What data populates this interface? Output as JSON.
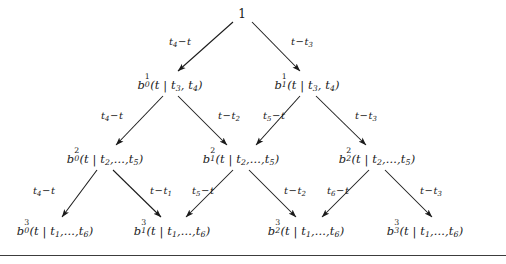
{
  "figure": {
    "type": "recursion-tree",
    "title": "",
    "background_color": "#ffffff",
    "ink_color": "#1a1a1a",
    "rule_color": "#3c3c3c"
  },
  "nodes": {
    "root": {
      "label": "1",
      "x": 242,
      "y": 14
    },
    "level1": [
      {
        "base": "b",
        "sub": "0",
        "sup": "1",
        "args": "(t | t",
        "argsub1": "3",
        "argmid": ", t",
        "argsub2": "4",
        "argend": ")",
        "text": "b_0^1(t | t_3, t_4)",
        "x": 170,
        "y": 85
      },
      {
        "base": "b",
        "sub": "1",
        "sup": "1",
        "args": "(t | t",
        "argsub1": "3",
        "argmid": ", t",
        "argsub2": "4",
        "argend": ")",
        "text": "b_1^1(t | t_3, t_4)",
        "x": 307,
        "y": 85
      }
    ],
    "level2": [
      {
        "base": "b",
        "sub": "0",
        "sup": "2",
        "args": "(t | t",
        "argsub1": "2",
        "argmid": ",...,t",
        "argsub2": "5",
        "argend": ")",
        "text": "b_0^2(t | t_2,...,t_5)",
        "x": 105,
        "y": 159
      },
      {
        "base": "b",
        "sub": "1",
        "sup": "2",
        "args": "(t | t",
        "argsub1": "2",
        "argmid": ",...,t",
        "argsub2": "5",
        "argend": ")",
        "text": "b_1^2(t | t_2,...,t_5)",
        "x": 241,
        "y": 159
      },
      {
        "base": "b",
        "sub": "2",
        "sup": "2",
        "args": "(t | t",
        "argsub1": "2",
        "argmid": ",...,t",
        "argsub2": "5",
        "argend": ")",
        "text": "b_2^2(t | t_2,...,t_5)",
        "x": 377,
        "y": 159
      }
    ],
    "level3": [
      {
        "base": "b",
        "sub": "0",
        "sup": "3",
        "args": "(t | t",
        "argsub1": "1",
        "argmid": ",...,t",
        "argsub2": "6",
        "argend": ")",
        "text": "b_0^3(t | t_1,...,t_6)",
        "x": 55,
        "y": 231
      },
      {
        "base": "b",
        "sub": "1",
        "sup": "3",
        "args": "(t | t",
        "argsub1": "1",
        "argmid": ",...,t",
        "argsub2": "6",
        "argend": ")",
        "text": "b_1^3(t | t_1,...,t_6)",
        "x": 172,
        "y": 231
      },
      {
        "base": "b",
        "sub": "2",
        "sup": "3",
        "args": "(t | t",
        "argsub1": "1",
        "argmid": ",...,t",
        "argsub2": "6",
        "argend": ")",
        "text": "b_2^3(t | t_1,...,t_6)",
        "x": 306,
        "y": 231
      },
      {
        "base": "b",
        "sub": "3",
        "sup": "3",
        "args": "(t | t",
        "argsub1": "1",
        "argmid": ",...,t",
        "argsub2": "6",
        "argend": ")",
        "text": "b_3^3(t | t_1,...,t_6)",
        "x": 425,
        "y": 231
      }
    ]
  },
  "edges": [
    {
      "from": "root",
      "to": "level1.0",
      "x1": 233,
      "y1": 22,
      "x2": 178,
      "y2": 72,
      "label": "t_4 - t",
      "lead": "t",
      "leadsub": "4",
      "tail": "t",
      "lx": 180,
      "ly": 43
    },
    {
      "from": "root",
      "to": "level1.1",
      "x1": 252,
      "y1": 22,
      "x2": 300,
      "y2": 72,
      "label": "t - t_3",
      "lead": "t",
      "leadsub": "",
      "tail": "t",
      "tailsub": "3",
      "lx": 302,
      "ly": 43
    },
    {
      "from": "level1.0",
      "to": "level2.0",
      "x1": 163,
      "y1": 96,
      "x2": 116,
      "y2": 146,
      "label": "t_4 - t",
      "lx": 112,
      "ly": 117
    },
    {
      "from": "level1.0",
      "to": "level2.1",
      "x1": 178,
      "y1": 96,
      "x2": 227,
      "y2": 146,
      "label": "t - t_2",
      "lx": 229,
      "ly": 117
    },
    {
      "from": "level1.1",
      "to": "level2.1",
      "x1": 300,
      "y1": 96,
      "x2": 255,
      "y2": 146,
      "label": "t_5 - t",
      "lx": 272,
      "ly": 117
    },
    {
      "from": "level1.1",
      "to": "level2.2",
      "x1": 316,
      "y1": 96,
      "x2": 366,
      "y2": 146,
      "label": "t - t_3",
      "lx": 365,
      "ly": 117
    },
    {
      "from": "level2.0",
      "to": "level3.0",
      "x1": 97,
      "y1": 170,
      "x2": 62,
      "y2": 218,
      "label": "t_4 - t",
      "lx": 44,
      "ly": 192
    },
    {
      "from": "level2.0",
      "to": "level3.1",
      "x1": 113,
      "y1": 170,
      "x2": 161,
      "y2": 218,
      "label": "t - t_1",
      "lx": 160,
      "ly": 192
    },
    {
      "from": "level2.1",
      "to": "level3.1",
      "x1": 233,
      "y1": 170,
      "x2": 185,
      "y2": 218,
      "label": "t_5 - t",
      "lx": 200,
      "ly": 192
    },
    {
      "from": "level2.1",
      "to": "level3.2",
      "x1": 249,
      "y1": 170,
      "x2": 296,
      "y2": 218,
      "label": "t - t_2",
      "lx": 294,
      "ly": 192
    },
    {
      "from": "level2.2",
      "to": "level3.2",
      "x1": 369,
      "y1": 170,
      "x2": 321,
      "y2": 218,
      "label": "t_6 - t",
      "lx": 335,
      "ly": 192
    },
    {
      "from": "level2.2",
      "to": "level3.3",
      "x1": 385,
      "y1": 170,
      "x2": 432,
      "y2": 218,
      "label": "t - t_3",
      "lx": 430,
      "ly": 192
    }
  ],
  "edge_labels": {
    "e0": {
      "a": "t",
      "asub": "4",
      "op": "−",
      "b": "t",
      "bsub": ""
    },
    "e1": {
      "a": "t",
      "asub": "",
      "op": "−",
      "b": "t",
      "bsub": "3"
    },
    "e2": {
      "a": "t",
      "asub": "4",
      "op": "−",
      "b": "t",
      "bsub": ""
    },
    "e3": {
      "a": "t",
      "asub": "",
      "op": "−",
      "b": "t",
      "bsub": "2"
    },
    "e4": {
      "a": "t",
      "asub": "5",
      "op": "−",
      "b": "t",
      "bsub": ""
    },
    "e5": {
      "a": "t",
      "asub": "",
      "op": "−",
      "b": "t",
      "bsub": "3"
    },
    "e6": {
      "a": "t",
      "asub": "4",
      "op": "−",
      "b": "t",
      "bsub": ""
    },
    "e7": {
      "a": "t",
      "asub": "",
      "op": "−",
      "b": "t",
      "bsub": "1"
    },
    "e8": {
      "a": "t",
      "asub": "5",
      "op": "−",
      "b": "t",
      "bsub": ""
    },
    "e9": {
      "a": "t",
      "asub": "",
      "op": "−",
      "b": "t",
      "bsub": "2"
    },
    "e10": {
      "a": "t",
      "asub": "6",
      "op": "−",
      "b": "t",
      "bsub": ""
    },
    "e11": {
      "a": "t",
      "asub": "",
      "op": "−",
      "b": "t",
      "bsub": "3"
    }
  },
  "divider": {
    "y": 255,
    "present": true
  }
}
